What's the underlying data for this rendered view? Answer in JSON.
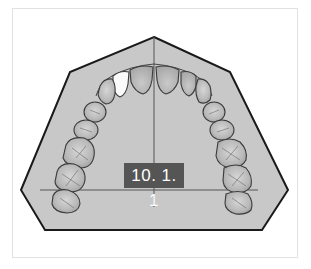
{
  "figure": {
    "label": "10. 1. 1",
    "highlighted_tooth": "upper-left lateral incisor",
    "colors": {
      "palate_fill": "#c8c8c8",
      "outline": "#1a1a1a",
      "tooth_fill": "#b4b4b4",
      "tooth_highlight": "#fafafa",
      "label_bg": "#555555",
      "label_text": "#ffffff",
      "frame_border": "#e2e2e2"
    }
  }
}
